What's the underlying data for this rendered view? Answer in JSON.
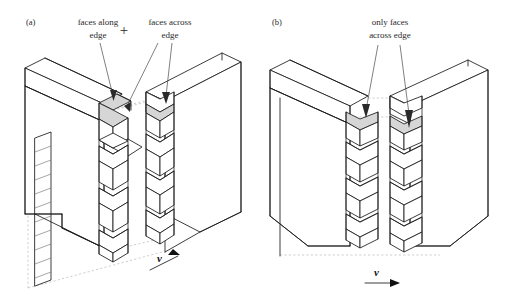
{
  "figure": {
    "background_color": "#ffffff",
    "line_color": "#1a1a1a",
    "shaded_face_color": "#d6d6d6",
    "construction_line_color": "#b9b9b9"
  },
  "panels": [
    {
      "id": "a",
      "label": "(a)",
      "annotations": [
        {
          "id": "faces-along-edge",
          "line1": "faces along",
          "line2": "edge"
        },
        {
          "id": "faces-across-edge",
          "line1": "faces across",
          "line2": "edge"
        }
      ],
      "operator": "+",
      "velocity_label": "v",
      "velocity_arrow_direction": "up-right",
      "teeth_rows": 6,
      "shaded_faces": 3,
      "has_hatched_strip": true,
      "hatch_segments": 11
    },
    {
      "id": "b",
      "label": "(b)",
      "annotations": [
        {
          "id": "only-faces-across-edge",
          "line1": "only faces",
          "line2": "across edge"
        }
      ],
      "operator": "",
      "velocity_label": "v",
      "velocity_arrow_direction": "right",
      "teeth_rows": 6,
      "shaded_faces": 2,
      "has_hatched_strip": false,
      "hatch_segments": 0
    }
  ]
}
